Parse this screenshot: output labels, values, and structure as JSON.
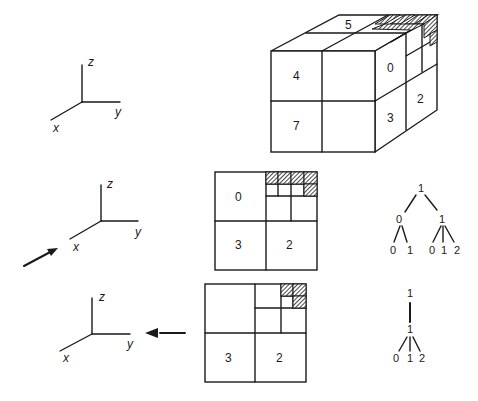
{
  "axes": [
    {
      "x_label": "x",
      "y_label": "y",
      "z_label": "z"
    },
    {
      "x_label": "x",
      "y_label": "y",
      "z_label": "z"
    },
    {
      "x_label": "x",
      "y_label": "y",
      "z_label": "z"
    }
  ],
  "cube": {
    "labels": {
      "top": "5",
      "front_tl": "4",
      "front_bl": "7",
      "side_tl": "0",
      "side_bl": "3",
      "side_br": "2"
    }
  },
  "quadtree_middle": {
    "labels": {
      "tl": "0",
      "bl": "3",
      "br": "2"
    }
  },
  "quadtree_bottom": {
    "labels": {
      "bl": "3",
      "br": "2"
    }
  },
  "tree_middle": {
    "root": "1",
    "left": "0",
    "right": "1",
    "left_children": [
      "0",
      "1"
    ],
    "right_children": [
      "0",
      "1",
      "2"
    ]
  },
  "tree_bottom": {
    "root": "1",
    "child": "1",
    "children": [
      "0",
      "1",
      "2"
    ]
  },
  "colors": {
    "ink": "#1a1a1a",
    "background": "#ffffff"
  }
}
